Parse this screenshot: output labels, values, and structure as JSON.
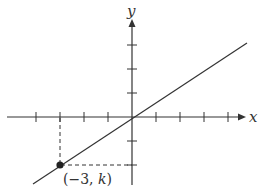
{
  "diagram": {
    "type": "coordinate-plane",
    "axes": {
      "x_label": "x",
      "y_label": "y",
      "x_ticks": [
        -4,
        -3,
        -2,
        -1,
        1,
        2,
        3,
        4
      ],
      "y_ticks": [
        -2,
        -1,
        1,
        2,
        3
      ]
    },
    "line": {
      "description": "straight line through the origin with positive slope",
      "passes_through": [
        [
          0,
          0
        ],
        [
          -3,
          -2
        ]
      ]
    },
    "point": {
      "coords": [
        -3,
        "k"
      ],
      "label": "(−3, k)",
      "label_prefix": "(−3, ",
      "label_var": "k",
      "label_suffix": ")"
    },
    "colors": {
      "stroke": "#333333",
      "point": "#222222",
      "background": "#ffffff"
    }
  }
}
